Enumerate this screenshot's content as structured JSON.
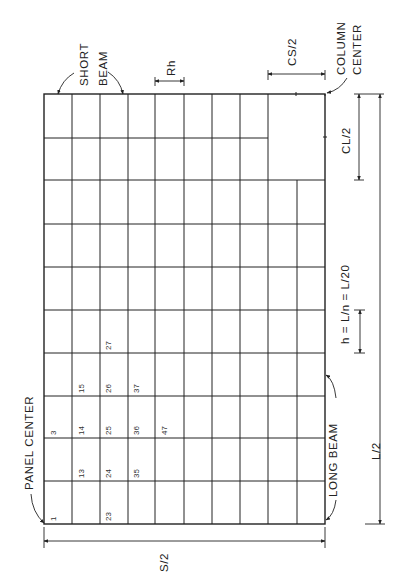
{
  "diagram": {
    "colors": {
      "line": "#222222",
      "background": "#ffffff"
    },
    "labels": {
      "short_beam_line1": "SHORT",
      "short_beam_line2": "BEAM",
      "rh": "Rh",
      "cs_half": "CS/2",
      "column_center_line1": "COLUMN",
      "column_center_line2": "CENTER",
      "cl_half": "CL/2",
      "h_formula": "h = L/n = L/20",
      "long_beam": "LONG BEAM",
      "l_half": "L/2",
      "panel_center": "PANEL CENTER",
      "s_half": "S/2"
    },
    "node_numbers": [
      {
        "id": "n1",
        "label": "1"
      },
      {
        "id": "n3",
        "label": "3"
      },
      {
        "id": "n13",
        "label": "13"
      },
      {
        "id": "n14",
        "label": "14"
      },
      {
        "id": "n15",
        "label": "15"
      },
      {
        "id": "n23",
        "label": "23"
      },
      {
        "id": "n24",
        "label": "24"
      },
      {
        "id": "n25",
        "label": "25"
      },
      {
        "id": "n26",
        "label": "26"
      },
      {
        "id": "n27",
        "label": "27"
      },
      {
        "id": "n35",
        "label": "35"
      },
      {
        "id": "n36",
        "label": "36"
      },
      {
        "id": "n37",
        "label": "37"
      },
      {
        "id": "n47",
        "label": "47"
      }
    ],
    "grid": {
      "columns": 10,
      "rows": 10
    }
  }
}
